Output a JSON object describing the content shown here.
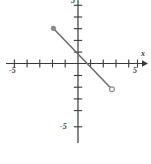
{
  "chart_data": {
    "type": "line",
    "title": "",
    "xlabel": "x",
    "ylabel": "",
    "xlim": [
      -6.7,
      6.3
    ],
    "ylim": [
      -6.5,
      5.4
    ],
    "grid": false,
    "legend": null,
    "x_tick_labels": [
      "-5",
      "5"
    ],
    "y_tick_labels": [
      "-5",
      "5"
    ],
    "x_ticks": [
      -5,
      -4,
      -3,
      -2,
      -1,
      1,
      2,
      3,
      4,
      5
    ],
    "y_ticks": [
      -5,
      -4,
      -3,
      -2,
      -1,
      1,
      2,
      3,
      4,
      5
    ],
    "tick_spacing_units": 1,
    "series": [
      {
        "name": "segment",
        "style": "solid",
        "color": "#6b6b6b",
        "x": [
          -2.1,
          2.9
        ],
        "y": [
          3.0,
          -2.2
        ],
        "endpoints": [
          {
            "x": -2.1,
            "y": 3.0,
            "marker": "closed-circle",
            "color": "#8a8a8a"
          },
          {
            "x": 2.9,
            "y": -2.2,
            "marker": "open-circle",
            "color": "#8a8a8a"
          }
        ],
        "y_intercept": 1.0,
        "x_intercept": 0.8
      }
    ],
    "annotations": []
  },
  "axes": {
    "x_axis_label": "x",
    "x_neg_label": "-5",
    "x_pos_label": "5",
    "y_neg_label": "-5",
    "y_pos_label": "5"
  },
  "colors": {
    "axis": "#3a3a3a",
    "line": "#6b6b6b",
    "marker": "#8a8a8a",
    "background": "#ffffff"
  }
}
